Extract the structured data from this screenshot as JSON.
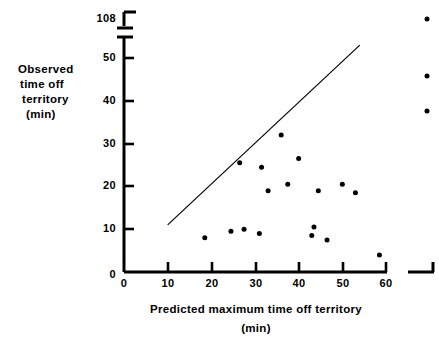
{
  "chart_data": {
    "type": "scatter",
    "title": "",
    "xlabel": "Predicted maximum time off territory (min)",
    "ylabel": "Observed time off territory (min)",
    "xlabel_lines": [
      "Predicted  maximum  time  off  territory",
      "(min)"
    ],
    "ylabel_lines": [
      "Observed",
      "time off",
      "territory",
      "(min)"
    ],
    "xlim": [
      0,
      60
    ],
    "ylim": [
      0,
      108
    ],
    "xticks": [
      0,
      10,
      20,
      30,
      40,
      50,
      60
    ],
    "xtick_labels": [
      "0",
      "10",
      "20",
      "30",
      "40",
      "50",
      "60"
    ],
    "yticks": [
      0,
      10,
      20,
      30,
      40,
      50,
      108
    ],
    "ytick_labels": [
      "0",
      "10",
      "20",
      "30",
      "40",
      "50",
      "108"
    ],
    "grid": false,
    "legend": null,
    "axis_break": {
      "y_break_between": [
        50,
        108
      ],
      "x_break_after": 60,
      "note": "both axes are broken near their upper ends to show outliers"
    },
    "marker": {
      "shape": "circle",
      "color": "#000000",
      "size_px": 5
    },
    "reference_line": {
      "label": "y = x line of equality",
      "color": "#000000",
      "width_px": 1.2,
      "from": [
        10,
        11
      ],
      "to": [
        54,
        53
      ]
    },
    "points": [
      {
        "x": 18.5,
        "y": 8.0
      },
      {
        "x": 24.5,
        "y": 9.5
      },
      {
        "x": 27.5,
        "y": 10.0
      },
      {
        "x": 31.0,
        "y": 9.0
      },
      {
        "x": 26.5,
        "y": 25.5
      },
      {
        "x": 31.5,
        "y": 24.5
      },
      {
        "x": 36.0,
        "y": 32.0
      },
      {
        "x": 33.0,
        "y": 19.0
      },
      {
        "x": 40.0,
        "y": 26.5
      },
      {
        "x": 37.5,
        "y": 20.5
      },
      {
        "x": 43.0,
        "y": 8.5
      },
      {
        "x": 43.5,
        "y": 10.5
      },
      {
        "x": 46.5,
        "y": 7.5
      },
      {
        "x": 44.5,
        "y": 19.0
      },
      {
        "x": 50.0,
        "y": 20.5
      },
      {
        "x": 53.0,
        "y": 18.5
      },
      {
        "x": 58.5,
        "y": 4.0
      }
    ],
    "outlier_points": [
      {
        "x": "beyond 60",
        "y": 108,
        "x_px": 427,
        "y_px": 19
      },
      {
        "x": "beyond 60",
        "y": 45,
        "x_px": 427,
        "y_px": 76
      },
      {
        "x": "beyond 60",
        "y": 37,
        "x_px": 427,
        "y_px": 111
      }
    ]
  }
}
